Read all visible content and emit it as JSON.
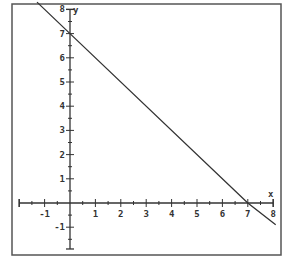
{
  "chart_data": {
    "type": "line",
    "title": "",
    "xlabel": "x",
    "ylabel": "y",
    "xlim": [
      -2,
      8
    ],
    "ylim": [
      -2,
      8
    ],
    "x_ticks": [
      -1,
      1,
      2,
      3,
      4,
      5,
      6,
      7,
      8
    ],
    "y_ticks": [
      -1,
      1,
      2,
      3,
      4,
      5,
      6,
      7,
      8
    ],
    "grid": false,
    "legend": null,
    "series": [
      {
        "name": "line",
        "equation": "y = -x + 7",
        "x": [
          -1.3,
          0,
          7,
          8.1
        ],
        "y": [
          8.3,
          7,
          0,
          -0.9
        ]
      }
    ],
    "annotations": {
      "y_intercept": [
        0,
        7
      ],
      "x_intercept": [
        7,
        0
      ]
    }
  },
  "labels": {
    "x_axis": "x",
    "y_axis": "y",
    "x_tick_labels": [
      "-1",
      "1",
      "2",
      "3",
      "4",
      "5",
      "6",
      "7",
      "8"
    ],
    "y_tick_labels": [
      "-1",
      "1",
      "2",
      "3",
      "4",
      "5",
      "6",
      "7",
      "8"
    ]
  },
  "colors": {
    "ink": "#333333",
    "frame": "#555555",
    "background": "#ffffff"
  }
}
